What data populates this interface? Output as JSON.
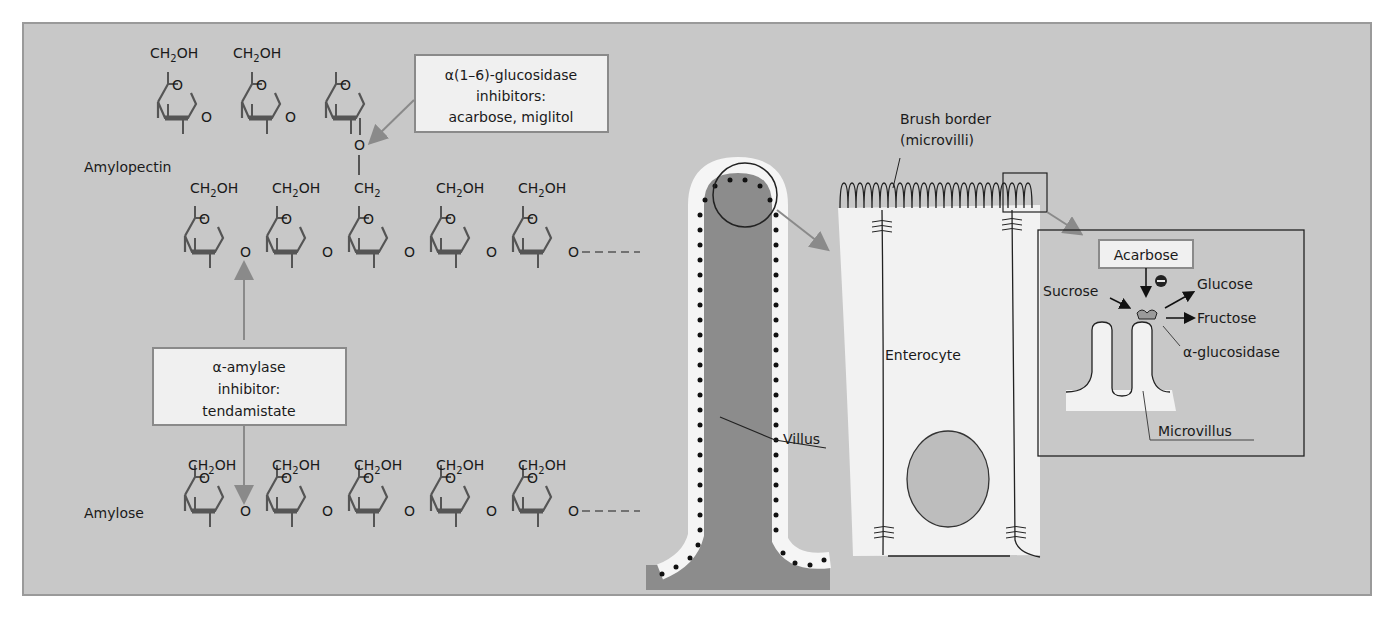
{
  "figure": {
    "background_color": "#c8c8c8",
    "box_fill": "#f0f0f0",
    "box_border": "#8a8a8a",
    "arrow_color": "#8a8a8a"
  },
  "molecules": {
    "amylopectin_label": "Amylopectin",
    "amylose_label": "Amylose",
    "ch2oh": "CH",
    "ch2oh_sub": "2",
    "ch2oh_tail": "OH",
    "ch2_label": "CH",
    "ring_oxygen": "O",
    "bridge_oxygen": "O",
    "chain_continuation": "----"
  },
  "callouts": {
    "glucosidase_inhibitors": {
      "line1": "α(1–6)-glucosidase",
      "line2": "inhibitors:",
      "line3": "acarbose, miglitol"
    },
    "amylase_inhibitor": {
      "line1": "α-amylase",
      "line2": "inhibitor:",
      "line3": "tendamistate"
    }
  },
  "villus": {
    "label": "Villus"
  },
  "enterocyte": {
    "label": "Enterocyte",
    "brush_border_line1": "Brush border",
    "brush_border_line2": "(microvilli)"
  },
  "inset": {
    "acarbose": "Acarbose",
    "inhibition_symbol": "−",
    "sucrose": "Sucrose",
    "glucose": "Glucose",
    "fructose": "Fructose",
    "enzyme": "α-glucosidase",
    "microvillus": "Microvillus"
  }
}
